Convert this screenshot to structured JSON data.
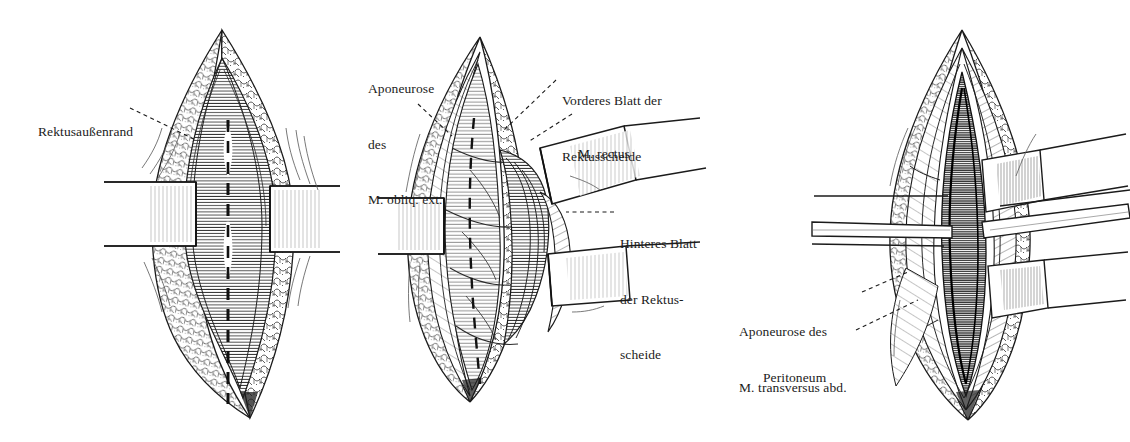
{
  "figure": {
    "kind": "surgical-anatomy-illustration",
    "style": "pen-and-ink engraving, black on white",
    "language": "German",
    "background_color": "#ffffff",
    "ink_color": "#1a1a1a",
    "panel_count": 3
  },
  "panels": [
    {
      "id": "panel-1",
      "order": 1,
      "description": "Skin and subcutaneous fat incised; lens-shaped wound held open by two retractor blades; dashed line marks the intended deeper incision along the rectus sheath",
      "apex_top": [
        222,
        30
      ],
      "apex_bottom": [
        250,
        418
      ],
      "labels": [
        "Rektusaußenrand"
      ]
    },
    {
      "id": "panel-2",
      "order": 2,
      "description": "Anterior rectus sheath opened and rectus muscle retracted laterally exposing the posterior sheath",
      "apex_top": [
        480,
        37
      ],
      "apex_bottom": [
        470,
        402
      ],
      "labels": [
        "Aponeurose des M. obliq. ext.",
        "Vorderes Blatt der Rektusscheide",
        "M. rectus",
        "Hinteres Blatt der Rektusscheide"
      ]
    },
    {
      "id": "panel-3",
      "order": 3,
      "description": "Deep dissection: posterior sheath, transversus aponeurosis and peritoneum opened, held by multiple narrow blades",
      "apex_top": [
        962,
        30
      ],
      "apex_bottom": [
        968,
        420
      ],
      "labels": [
        "Aponeurose des M. transversus abd.",
        "Peritoneum"
      ]
    }
  ],
  "annotations": [
    {
      "id": "rektusaussenrand",
      "panel": "panel-1",
      "lines": [
        "Rektusaußenrand"
      ],
      "text_x": 38,
      "text_y": 86,
      "align": "left",
      "leader": {
        "from": [
          130,
          108
        ],
        "to": [
          196,
          140
        ],
        "style": "dashed"
      }
    },
    {
      "id": "aponeurose-obliq-ext",
      "panel": "panel-2",
      "lines": [
        "Aponeurose",
        "des",
        "M. obliq. ext."
      ],
      "text_x": 368,
      "text_y": 43,
      "align": "left",
      "leader": {
        "from": [
          418,
          104
        ],
        "to": [
          452,
          136
        ],
        "style": "dashed"
      }
    },
    {
      "id": "vorderes-blatt-rektusscheide",
      "panel": "panel-2",
      "lines": [
        "Vorderes Blatt der",
        "Rektusscheide"
      ],
      "text_x": 562,
      "text_y": 55,
      "align": "left",
      "leader": {
        "from": [
          556,
          80
        ],
        "to": [
          504,
          130
        ],
        "style": "dashed"
      }
    },
    {
      "id": "m-rectus",
      "panel": "panel-2",
      "lines": [
        "M. rectus"
      ],
      "text_x": 578,
      "text_y": 108,
      "align": "left",
      "leader": {
        "from": [
          572,
          114
        ],
        "to": [
          528,
          142
        ],
        "style": "dashed"
      }
    },
    {
      "id": "hinteres-blatt-rektusscheide",
      "panel": "panel-2",
      "lines": [
        "Hinteres Blatt",
        "der Rektus-",
        "scheide"
      ],
      "text_x": 620,
      "text_y": 198,
      "align": "left",
      "leader": {
        "from": [
          614,
          212
        ],
        "to": [
          566,
          212
        ],
        "style": "dashed"
      }
    },
    {
      "id": "aponeurose-transversus",
      "panel": "panel-3",
      "lines": [
        "Aponeurose des",
        "M. transversus abd."
      ],
      "text_x": 739,
      "text_y": 286,
      "align": "left",
      "leader": {
        "from": [
          862,
          292
        ],
        "to": [
          908,
          272
        ],
        "style": "dashed"
      }
    },
    {
      "id": "peritoneum",
      "panel": "panel-3",
      "lines": [
        "Peritoneum"
      ],
      "text_x": 763,
      "text_y": 332,
      "align": "left",
      "leader": {
        "from": [
          856,
          330
        ],
        "to": [
          918,
          300
        ],
        "style": "dashed"
      }
    }
  ]
}
